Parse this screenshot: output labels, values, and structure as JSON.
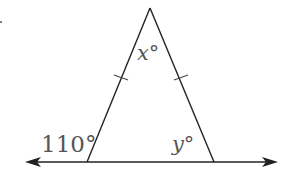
{
  "diagram": {
    "type": "isosceles triangle on a line",
    "labels": {
      "apex_angle": "x°",
      "exterior_angle": "110°",
      "base_right_angle": "y°"
    },
    "colors": {
      "stroke": "#222222",
      "label": "#555555"
    }
  }
}
